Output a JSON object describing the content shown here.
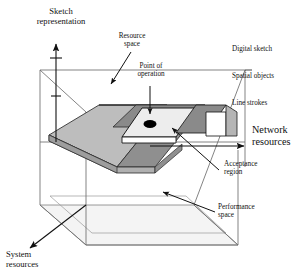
{
  "figure": {
    "kind": "3d-axes-diagram",
    "title_implicit": "Resource space with acceptance region and point of operation",
    "background_color": "#ffffff",
    "line_color": "#1a1a1a",
    "colors": {
      "surface_light": "#bdbdbd",
      "surface_mid": "#a6a6a6",
      "surface_dark": "#8a8a8a",
      "surface_pale": "#ececec",
      "floor": "#f2f2f2",
      "point_marker": "#000000",
      "outline": "#1a1a1a",
      "thin_outline": "#707070"
    }
  },
  "axes": [
    {
      "id": "vertical-axis",
      "label": "Sketch\nrepresentation",
      "direction": "up",
      "tick_count": 2,
      "label_position": "top-left"
    },
    {
      "id": "horizontal-axis",
      "label": "Network\nresources",
      "direction": "right",
      "label_position": "right"
    },
    {
      "id": "depth-axis",
      "label": "System\nresources",
      "direction": "down-left",
      "label_position": "bottom-left"
    }
  ],
  "axis_value_labels": [
    {
      "id": "digital-sketch",
      "text": "Digital sketch"
    },
    {
      "id": "spatial-objects",
      "text": "Spatial objects"
    },
    {
      "id": "line-strokes",
      "text": "Line strokes"
    }
  ],
  "callouts": [
    {
      "id": "resource-space",
      "text": "Resource\nspace",
      "arrow": "down-left",
      "target": "box-interior-top"
    },
    {
      "id": "point-of-operation",
      "text": "Point of\noperation",
      "arrow": "down",
      "target": "black-dot-marker"
    },
    {
      "id": "acceptance-region",
      "text": "Acceptance\nregion",
      "arrow": "up-left",
      "target": "pale-plateau-region"
    },
    {
      "id": "performance-space",
      "text": "Performance\nspace",
      "arrow": "up-left",
      "target": "box-floor"
    }
  ],
  "markers": [
    {
      "id": "point-of-operation-dot",
      "shape": "filled-ellipse",
      "color": "#000000",
      "x": 168,
      "y": 122,
      "rx": 6.5,
      "ry": 4.0
    }
  ]
}
